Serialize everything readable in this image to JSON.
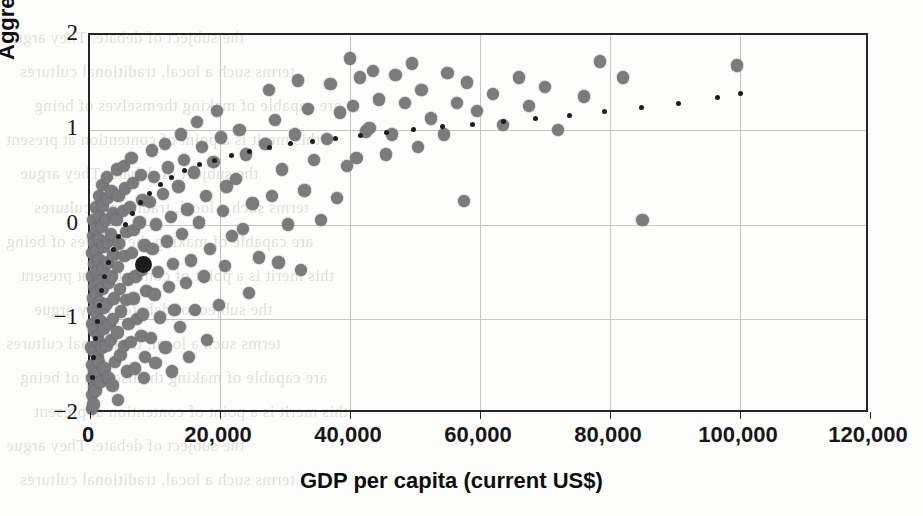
{
  "chart_data": {
    "type": "scatter",
    "title": "",
    "xlabel": "GDP per capita (current US$)",
    "ylabel": "Aggregate WGI indicators",
    "xlim": [
      0,
      120000
    ],
    "ylim": [
      -2,
      2
    ],
    "xticks": [
      0,
      20000,
      40000,
      60000,
      80000,
      100000,
      120000
    ],
    "xtick_labels": [
      "0",
      "20,000",
      "40,000",
      "60,000",
      "80,000",
      "100,000",
      "120,000"
    ],
    "yticks": [
      -2,
      -1,
      0,
      1,
      2
    ],
    "ytick_labels": [
      "-2",
      "-1",
      "0",
      "1",
      "2"
    ],
    "grid": true,
    "legend": "none",
    "series": [
      {
        "name": "Countries",
        "marker": "circle",
        "color": "#7b7b7e",
        "points": [
          [
            300,
            -0.3
          ],
          [
            350,
            -0.55
          ],
          [
            420,
            -0.78
          ],
          [
            300,
            -1.05
          ],
          [
            250,
            -1.3
          ],
          [
            400,
            -1.48
          ],
          [
            330,
            -1.62
          ],
          [
            300,
            -1.8
          ],
          [
            260,
            -1.95
          ],
          [
            500,
            -0.12
          ],
          [
            480,
            0.05
          ],
          [
            600,
            -0.2
          ],
          [
            700,
            -0.42
          ],
          [
            620,
            -0.66
          ],
          [
            560,
            -0.9
          ],
          [
            650,
            -1.12
          ],
          [
            720,
            -1.34
          ],
          [
            600,
            -1.55
          ],
          [
            680,
            -1.72
          ],
          [
            520,
            -1.9
          ],
          [
            900,
            0.18
          ],
          [
            950,
            -0.05
          ],
          [
            1000,
            -0.28
          ],
          [
            1100,
            -0.5
          ],
          [
            980,
            -0.72
          ],
          [
            1050,
            -0.95
          ],
          [
            1200,
            -1.18
          ],
          [
            1150,
            -1.4
          ],
          [
            1000,
            -1.58
          ],
          [
            900,
            -1.75
          ],
          [
            1400,
            0.3
          ],
          [
            1500,
            0.08
          ],
          [
            1350,
            -0.15
          ],
          [
            1450,
            -0.38
          ],
          [
            1600,
            -0.6
          ],
          [
            1550,
            -0.82
          ],
          [
            1700,
            -1.02
          ],
          [
            1480,
            -1.25
          ],
          [
            1380,
            -1.45
          ],
          [
            1620,
            -1.66
          ],
          [
            1900,
            0.42
          ],
          [
            2000,
            0.2
          ],
          [
            1850,
            -0.02
          ],
          [
            2100,
            -0.24
          ],
          [
            2050,
            -0.46
          ],
          [
            1950,
            -0.68
          ],
          [
            2200,
            -0.88
          ],
          [
            2150,
            -1.1
          ],
          [
            1880,
            -1.3
          ],
          [
            2250,
            -1.52
          ],
          [
            2600,
            0.5
          ],
          [
            2700,
            0.28
          ],
          [
            2500,
            0.05
          ],
          [
            2800,
            -0.18
          ],
          [
            2750,
            -0.4
          ],
          [
            2900,
            -0.62
          ],
          [
            2650,
            -0.84
          ],
          [
            3000,
            -1.05
          ],
          [
            2550,
            -1.28
          ],
          [
            2850,
            -1.62
          ],
          [
            3300,
            0.35
          ],
          [
            3500,
            0.12
          ],
          [
            3200,
            -0.1
          ],
          [
            3600,
            -0.32
          ],
          [
            3400,
            -0.55
          ],
          [
            3700,
            -0.78
          ],
          [
            3550,
            -1.0
          ],
          [
            3250,
            -1.22
          ],
          [
            3800,
            -1.45
          ],
          [
            3450,
            -1.7
          ],
          [
            4200,
            0.58
          ],
          [
            4400,
            0.3
          ],
          [
            4100,
            0.05
          ],
          [
            4500,
            -0.2
          ],
          [
            4300,
            -0.45
          ],
          [
            4600,
            -0.68
          ],
          [
            4800,
            -0.92
          ],
          [
            4250,
            -1.14
          ],
          [
            4700,
            -1.38
          ],
          [
            4350,
            -1.85
          ],
          [
            5200,
            0.62
          ],
          [
            5400,
            0.38
          ],
          [
            5100,
            0.14
          ],
          [
            5600,
            -0.08
          ],
          [
            5300,
            -0.33
          ],
          [
            5800,
            -0.58
          ],
          [
            5500,
            -0.8
          ],
          [
            5900,
            -1.05
          ],
          [
            5250,
            -1.28
          ],
          [
            5700,
            -1.55
          ],
          [
            6400,
            0.7
          ],
          [
            6600,
            0.44
          ],
          [
            6200,
            0.18
          ],
          [
            6800,
            -0.06
          ],
          [
            6500,
            -0.3
          ],
          [
            7000,
            -0.55
          ],
          [
            6700,
            -0.78
          ],
          [
            7200,
            -1.0
          ],
          [
            6300,
            -1.24
          ],
          [
            6900,
            -1.52
          ],
          [
            7800,
            0.52
          ],
          [
            8100,
            0.26
          ],
          [
            7600,
            0.02
          ],
          [
            8400,
            -0.22
          ],
          [
            8000,
            -0.48
          ],
          [
            8700,
            -0.7
          ],
          [
            8200,
            -0.95
          ],
          [
            7900,
            -1.18
          ],
          [
            8500,
            -1.4
          ],
          [
            8300,
            -1.62
          ],
          [
            9500,
            0.78
          ],
          [
            9800,
            0.5
          ],
          [
            9200,
            0.24
          ],
          [
            10200,
            0.0
          ],
          [
            9600,
            -0.26
          ],
          [
            10500,
            -0.5
          ],
          [
            9900,
            -0.74
          ],
          [
            10800,
            -0.98
          ],
          [
            9400,
            -1.2
          ],
          [
            10100,
            -1.46
          ],
          [
            11500,
            0.85
          ],
          [
            12000,
            0.6
          ],
          [
            11200,
            0.32
          ],
          [
            12500,
            0.08
          ],
          [
            11800,
            -0.18
          ],
          [
            12800,
            -0.42
          ],
          [
            12200,
            -0.66
          ],
          [
            13000,
            -0.9
          ],
          [
            11600,
            -1.3
          ],
          [
            12600,
            -1.55
          ],
          [
            14000,
            0.95
          ],
          [
            14500,
            0.68
          ],
          [
            13600,
            0.4
          ],
          [
            15000,
            0.16
          ],
          [
            14200,
            -0.1
          ],
          [
            15500,
            -0.38
          ],
          [
            14800,
            -0.62
          ],
          [
            13800,
            -1.08
          ],
          [
            15200,
            -1.4
          ],
          [
            16500,
            1.08
          ],
          [
            17200,
            0.82
          ],
          [
            16000,
            0.55
          ],
          [
            17800,
            0.3
          ],
          [
            16800,
            0.02
          ],
          [
            18500,
            -0.26
          ],
          [
            17500,
            -0.55
          ],
          [
            16200,
            -0.9
          ],
          [
            18000,
            -1.22
          ],
          [
            19500,
            1.2
          ],
          [
            20200,
            0.92
          ],
          [
            19000,
            0.66
          ],
          [
            21000,
            0.4
          ],
          [
            20500,
            0.14
          ],
          [
            21800,
            -0.12
          ],
          [
            20800,
            -0.44
          ],
          [
            19800,
            -0.85
          ],
          [
            23000,
            1.0
          ],
          [
            24000,
            0.74
          ],
          [
            22500,
            0.48
          ],
          [
            25000,
            0.22
          ],
          [
            23500,
            -0.05
          ],
          [
            26000,
            -0.35
          ],
          [
            24500,
            -0.72
          ],
          [
            27500,
            1.42
          ],
          [
            28500,
            1.1
          ],
          [
            27000,
            0.85
          ],
          [
            29500,
            0.58
          ],
          [
            28000,
            0.3
          ],
          [
            30500,
            0.0
          ],
          [
            29000,
            -0.4
          ],
          [
            32000,
            1.52
          ],
          [
            33500,
            1.22
          ],
          [
            31500,
            0.95
          ],
          [
            34500,
            0.68
          ],
          [
            33000,
            0.36
          ],
          [
            35500,
            0.05
          ],
          [
            32500,
            -0.48
          ],
          [
            37000,
            1.48
          ],
          [
            38500,
            1.18
          ],
          [
            36500,
            0.9
          ],
          [
            39500,
            0.62
          ],
          [
            38000,
            0.28
          ],
          [
            40000,
            1.75
          ],
          [
            41500,
            1.55
          ],
          [
            40500,
            1.25
          ],
          [
            42500,
            0.98
          ],
          [
            41000,
            0.7
          ],
          [
            43500,
            1.62
          ],
          [
            44500,
            1.32
          ],
          [
            43000,
            1.02
          ],
          [
            45500,
            0.74
          ],
          [
            47000,
            1.58
          ],
          [
            48500,
            1.28
          ],
          [
            46500,
            0.95
          ],
          [
            49500,
            1.7
          ],
          [
            51000,
            1.42
          ],
          [
            52500,
            1.12
          ],
          [
            50500,
            0.82
          ],
          [
            55000,
            1.6
          ],
          [
            56500,
            1.28
          ],
          [
            54500,
            0.95
          ],
          [
            58000,
            1.5
          ],
          [
            59500,
            1.2
          ],
          [
            57500,
            0.25
          ],
          [
            62000,
            1.38
          ],
          [
            63500,
            1.05
          ],
          [
            66000,
            1.55
          ],
          [
            67500,
            1.25
          ],
          [
            70000,
            1.45
          ],
          [
            72000,
            1.0
          ],
          [
            76000,
            1.35
          ],
          [
            78500,
            1.72
          ],
          [
            82000,
            1.55
          ],
          [
            85000,
            0.05
          ],
          [
            99500,
            1.68
          ]
        ]
      },
      {
        "name": "Highlighted country",
        "marker": "circle-large",
        "color": "#1c1c1e",
        "points": [
          [
            8300,
            -0.42
          ]
        ]
      }
    ],
    "trendline": {
      "style": "dotted",
      "color": "#1d1d20",
      "shape": "logarithmic",
      "x_range": [
        400,
        100000
      ],
      "points": [
        [
          400,
          -1.62
        ],
        [
          600,
          -1.4
        ],
        [
          850,
          -1.2
        ],
        [
          1100,
          -1.02
        ],
        [
          1400,
          -0.86
        ],
        [
          1800,
          -0.7
        ],
        [
          2300,
          -0.55
        ],
        [
          2900,
          -0.4
        ],
        [
          3600,
          -0.26
        ],
        [
          4400,
          -0.13
        ],
        [
          5400,
          0.0
        ],
        [
          6500,
          0.12
        ],
        [
          7800,
          0.23
        ],
        [
          9200,
          0.33
        ],
        [
          10800,
          0.42
        ],
        [
          12600,
          0.5
        ],
        [
          14600,
          0.57
        ],
        [
          16800,
          0.63
        ],
        [
          19200,
          0.68
        ],
        [
          21800,
          0.73
        ],
        [
          24600,
          0.77
        ],
        [
          27600,
          0.81
        ],
        [
          30800,
          0.85
        ],
        [
          34200,
          0.88
        ],
        [
          37800,
          0.91
        ],
        [
          41600,
          0.94
        ],
        [
          45600,
          0.97
        ],
        [
          49800,
          1.0
        ],
        [
          54200,
          1.03
        ],
        [
          58800,
          1.06
        ],
        [
          63600,
          1.09
        ],
        [
          68600,
          1.12
        ],
        [
          73800,
          1.15
        ],
        [
          79200,
          1.19
        ],
        [
          84800,
          1.23
        ],
        [
          90600,
          1.28
        ],
        [
          96600,
          1.34
        ],
        [
          100000,
          1.38
        ]
      ]
    }
  },
  "page": {
    "bleed_lines": [
      "the subject of debate. They argue",
      "terms such a local, traditional cultures",
      "are capable of making themselves of being",
      "this merit is a point of contention at present"
    ]
  }
}
